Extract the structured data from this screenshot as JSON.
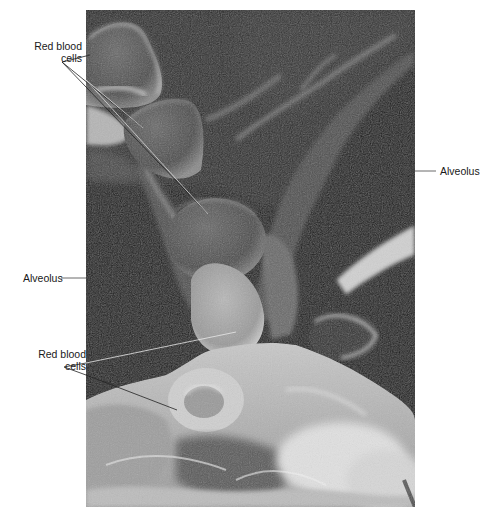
{
  "figure": {
    "type": "scanning electron micrograph",
    "labels": {
      "top_left_rbc": {
        "line1": "Red blood",
        "line2": "cells"
      },
      "right_alveolus": "Alveolus",
      "left_alveolus": "Alveolus",
      "bottom_left_rbc": {
        "line1": "Red blood",
        "line2": "cells"
      }
    }
  }
}
